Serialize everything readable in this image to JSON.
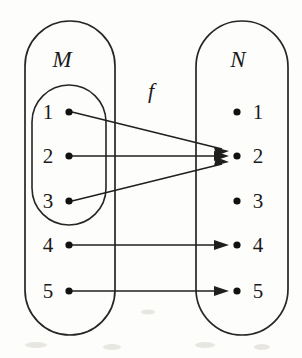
{
  "diagram": {
    "type": "function-mapping-diagram",
    "title": "",
    "function_label": "f",
    "background_color": "#fdfdfb",
    "ink_color": "#1a1a1a",
    "domain_set": {
      "name": "M",
      "label": "M",
      "elements": [
        "1",
        "2",
        "3",
        "4",
        "5"
      ],
      "subset": {
        "name": "inner-oval",
        "elements": [
          "1",
          "2",
          "3"
        ]
      }
    },
    "codomain_set": {
      "name": "N",
      "label": "N",
      "elements": [
        "1",
        "2",
        "3",
        "4",
        "5"
      ]
    },
    "mappings": [
      {
        "from": "1",
        "to": "2"
      },
      {
        "from": "2",
        "to": "2"
      },
      {
        "from": "3",
        "to": "2"
      },
      {
        "from": "4",
        "to": "4"
      },
      {
        "from": "5",
        "to": "5"
      }
    ]
  }
}
